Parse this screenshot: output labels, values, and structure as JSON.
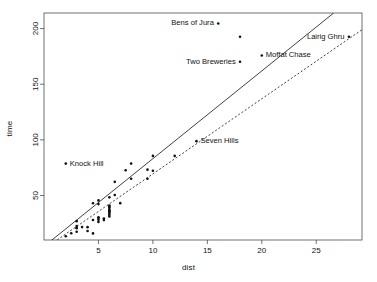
{
  "chart_data": {
    "type": "scatter",
    "title": "",
    "xlabel": "dist",
    "ylabel": "time",
    "xlim": [
      0.0,
      29.2
    ],
    "ylim": [
      10.0,
      214.0
    ],
    "xticks": [
      5,
      10,
      15,
      20,
      25
    ],
    "yticks": [
      50,
      100,
      150,
      200
    ],
    "grid": false,
    "legend": null,
    "point_marker": "dot",
    "series": [
      {
        "name": "Scottish hill races",
        "points": [
          {
            "x": 2.5,
            "y": 16.08
          },
          {
            "x": 6.0,
            "y": 48.35
          },
          {
            "x": 6.0,
            "y": 33.65
          },
          {
            "x": 5.0,
            "y": 45.6
          },
          {
            "x": 6.5,
            "y": 62.27
          },
          {
            "x": 5.0,
            "y": 26.22
          },
          {
            "x": 20.0,
            "y": 175.83
          },
          {
            "x": 6.0,
            "y": 32.57
          },
          {
            "x": 5.0,
            "y": 28.1
          },
          {
            "x": 10.0,
            "y": 85.58
          },
          {
            "x": 6.0,
            "y": 31.18
          },
          {
            "x": 18.0,
            "y": 170.25
          },
          {
            "x": 4.5,
            "y": 28.02
          },
          {
            "x": 3.0,
            "y": 17.42
          },
          {
            "x": 4.5,
            "y": 15.95
          },
          {
            "x": 5.5,
            "y": 27.9
          },
          {
            "x": 3.0,
            "y": 20.95
          },
          {
            "x": 3.5,
            "y": 21.6
          },
          {
            "x": 6.0,
            "y": 36.37
          },
          {
            "x": 2.0,
            "y": 13.35
          },
          {
            "x": 3.0,
            "y": 20.65
          },
          {
            "x": 4.0,
            "y": 18.15
          },
          {
            "x": 6.0,
            "y": 36.17
          },
          {
            "x": 5.0,
            "y": 42.27
          },
          {
            "x": 6.5,
            "y": 50.42
          },
          {
            "x": 5.0,
            "y": 30.4
          },
          {
            "x": 10.0,
            "y": 72.25
          },
          {
            "x": 6.0,
            "y": 39.75
          },
          {
            "x": 18.0,
            "y": 192.67
          },
          {
            "x": 4.5,
            "y": 43.05
          },
          {
            "x": 3.0,
            "y": 26.93
          },
          {
            "x": 5.5,
            "y": 29.23
          },
          {
            "x": 4.0,
            "y": 21.57
          },
          {
            "x": 6.0,
            "y": 39.75
          },
          {
            "x": 7.5,
            "y": 72.63
          },
          {
            "x": 8.0,
            "y": 78.65
          },
          {
            "x": 16.0,
            "y": 204.62
          },
          {
            "x": 6.0,
            "y": 36.37
          },
          {
            "x": 5.0,
            "y": 29.75
          },
          {
            "x": 14.0,
            "y": 98.82
          },
          {
            "x": 9.5,
            "y": 73.22
          },
          {
            "x": 6.0,
            "y": 35.0
          },
          {
            "x": 6.0,
            "y": 38.0
          },
          {
            "x": 28.0,
            "y": 192.67
          },
          {
            "x": 7.0,
            "y": 43.12
          },
          {
            "x": 8.0,
            "y": 65.0
          },
          {
            "x": 9.5,
            "y": 65.0
          },
          {
            "x": 2.0,
            "y": 78.65
          },
          {
            "x": 6.0,
            "y": 41.0
          },
          {
            "x": 3.0,
            "y": 22.5
          },
          {
            "x": 12.0,
            "y": 85.58
          }
        ]
      }
    ],
    "fit_lines": [
      {
        "name": "least-squares-fit",
        "style": "solid",
        "x0": 0.6,
        "y0": 9.0,
        "x1": 26.6,
        "y1": 214.0
      },
      {
        "name": "robust-fit",
        "style": "dashed",
        "x0": 0.6,
        "y0": 6.0,
        "x1": 29.2,
        "y1": 199.0
      }
    ],
    "annotations": [
      {
        "label": "Bens of Jura",
        "x": 16.0,
        "y": 204.62,
        "label_side": "left"
      },
      {
        "label": "Lairig Ghru",
        "x": 28.0,
        "y": 192.67,
        "label_side": "left"
      },
      {
        "label": "Two Breweries",
        "x": 18.0,
        "y": 170.25,
        "label_side": "left"
      },
      {
        "label": "Moffat Chase",
        "x": 20.0,
        "y": 175.83,
        "label_side": "right"
      },
      {
        "label": "Seven Hills",
        "x": 14.0,
        "y": 98.82,
        "label_side": "right"
      },
      {
        "label": "Knock Hill",
        "x": 2.0,
        "y": 78.65,
        "label_side": "right"
      }
    ]
  }
}
